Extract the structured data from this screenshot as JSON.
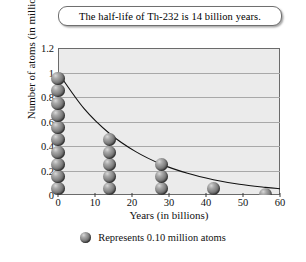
{
  "title": {
    "text": "The half-life of Th-232 is 14 billion years."
  },
  "legend": {
    "icon": "sphere-icon",
    "text": "Represents 0.10 million atoms"
  },
  "chart_data": {
    "type": "scatter",
    "title": "The half-life of Th-232 is 14 billion years.",
    "xlabel": "Years (in billions)",
    "ylabel": "Number of atoms (in millions)",
    "xlim": [
      0,
      60
    ],
    "ylim": [
      0,
      1.2
    ],
    "xticks": [
      0,
      10,
      20,
      30,
      40,
      50,
      60
    ],
    "xtick_labels": [
      "0",
      "10",
      "20",
      "30",
      "40",
      "50",
      "60"
    ],
    "yticks": [
      0,
      0.2,
      0.4,
      0.6,
      0.8,
      1,
      1.2
    ],
    "ytick_labels": [
      "0",
      "0.2",
      "0.4",
      "0.6",
      "0.8",
      "1",
      "1.2"
    ],
    "grid": "horizontal",
    "legend_position": "below-plot",
    "unit_per_marker": 0.1,
    "half_life_years": 14,
    "initial_atoms": 1.0,
    "x": [
      0,
      14,
      28,
      42,
      56
    ],
    "y": [
      1.0,
      0.5,
      0.25,
      0.125,
      0.0625
    ],
    "marker_counts": [
      10,
      5,
      3,
      1,
      1
    ],
    "marker_partial_last": true,
    "curve": {
      "label": "exponential decay",
      "formula": "y = 1.0 * 0.5^(x/14)",
      "points": [
        {
          "x": 0,
          "y": 1.0
        },
        {
          "x": 7,
          "y": 0.707
        },
        {
          "x": 14,
          "y": 0.5
        },
        {
          "x": 21,
          "y": 0.354
        },
        {
          "x": 28,
          "y": 0.25
        },
        {
          "x": 35,
          "y": 0.177
        },
        {
          "x": 42,
          "y": 0.125
        },
        {
          "x": 49,
          "y": 0.088
        },
        {
          "x": 56,
          "y": 0.0625
        },
        {
          "x": 60,
          "y": 0.051
        }
      ]
    },
    "colors": {
      "plot_background": "#ebebeb",
      "gridline": "#a8a8a8",
      "axis": "#3a3a3a",
      "curve": "#111111",
      "marker": "#6e6e6e"
    }
  }
}
